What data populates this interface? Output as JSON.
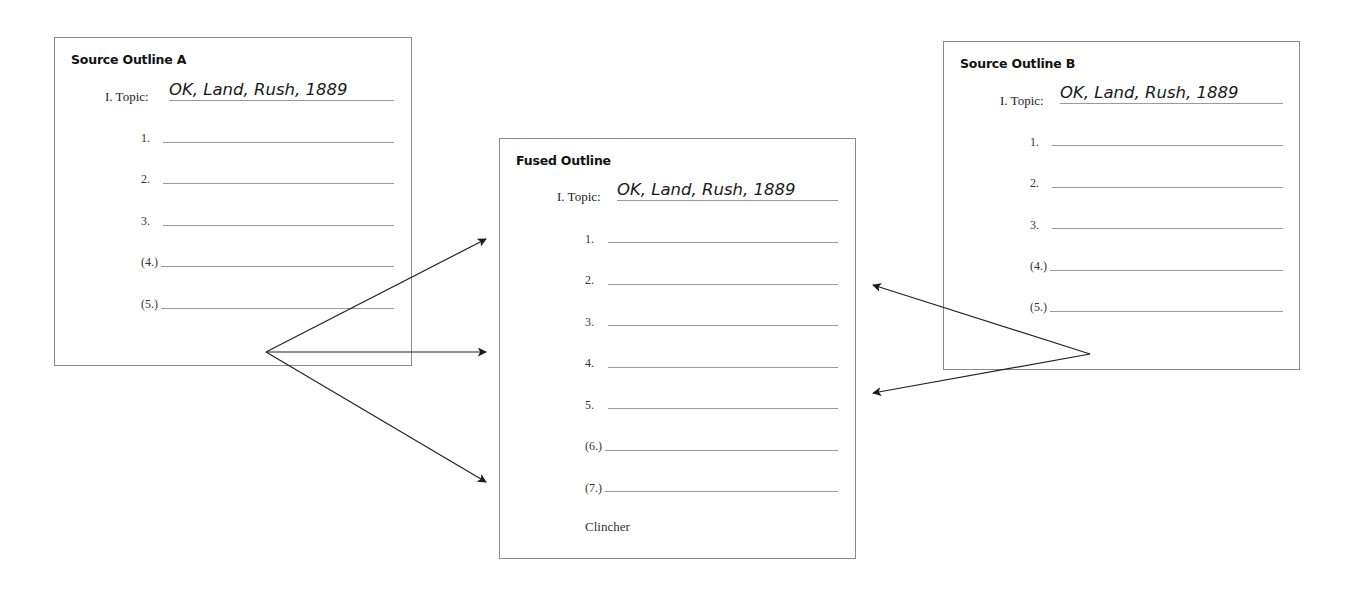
{
  "outlines": {
    "source_a": {
      "title": "Source Outline A",
      "topic_label": "I. Topic:",
      "topic_value": "OK, Land, Rush, 1889",
      "items": [
        "1.",
        "2.",
        "3.",
        "(4.)",
        "(5.)"
      ]
    },
    "fused": {
      "title": "Fused Outline",
      "topic_label": "I. Topic:",
      "topic_value": "OK, Land, Rush, 1889",
      "items": [
        "1.",
        "2.",
        "3.",
        "4.",
        "5.",
        "(6.)",
        "(7.)"
      ],
      "clincher": "Clincher"
    },
    "source_b": {
      "title": "Source Outline B",
      "topic_label": "I. Topic:",
      "topic_value": "OK, Land, Rush, 1889",
      "items": [
        "1.",
        "2.",
        "3.",
        "(4.)",
        "(5.)"
      ]
    }
  },
  "arrows": {
    "from_a": {
      "origin": [
        266,
        352
      ],
      "targets": [
        [
          486,
          239
        ],
        [
          486,
          352
        ],
        [
          486,
          482
        ]
      ]
    },
    "from_b": {
      "origin": [
        1090,
        354
      ],
      "targets": [
        [
          873,
          285
        ],
        [
          873,
          393
        ]
      ]
    }
  },
  "colors": {
    "border": "#8a8a8a",
    "rule": "#9a9a9a",
    "arrow": "#222222"
  }
}
